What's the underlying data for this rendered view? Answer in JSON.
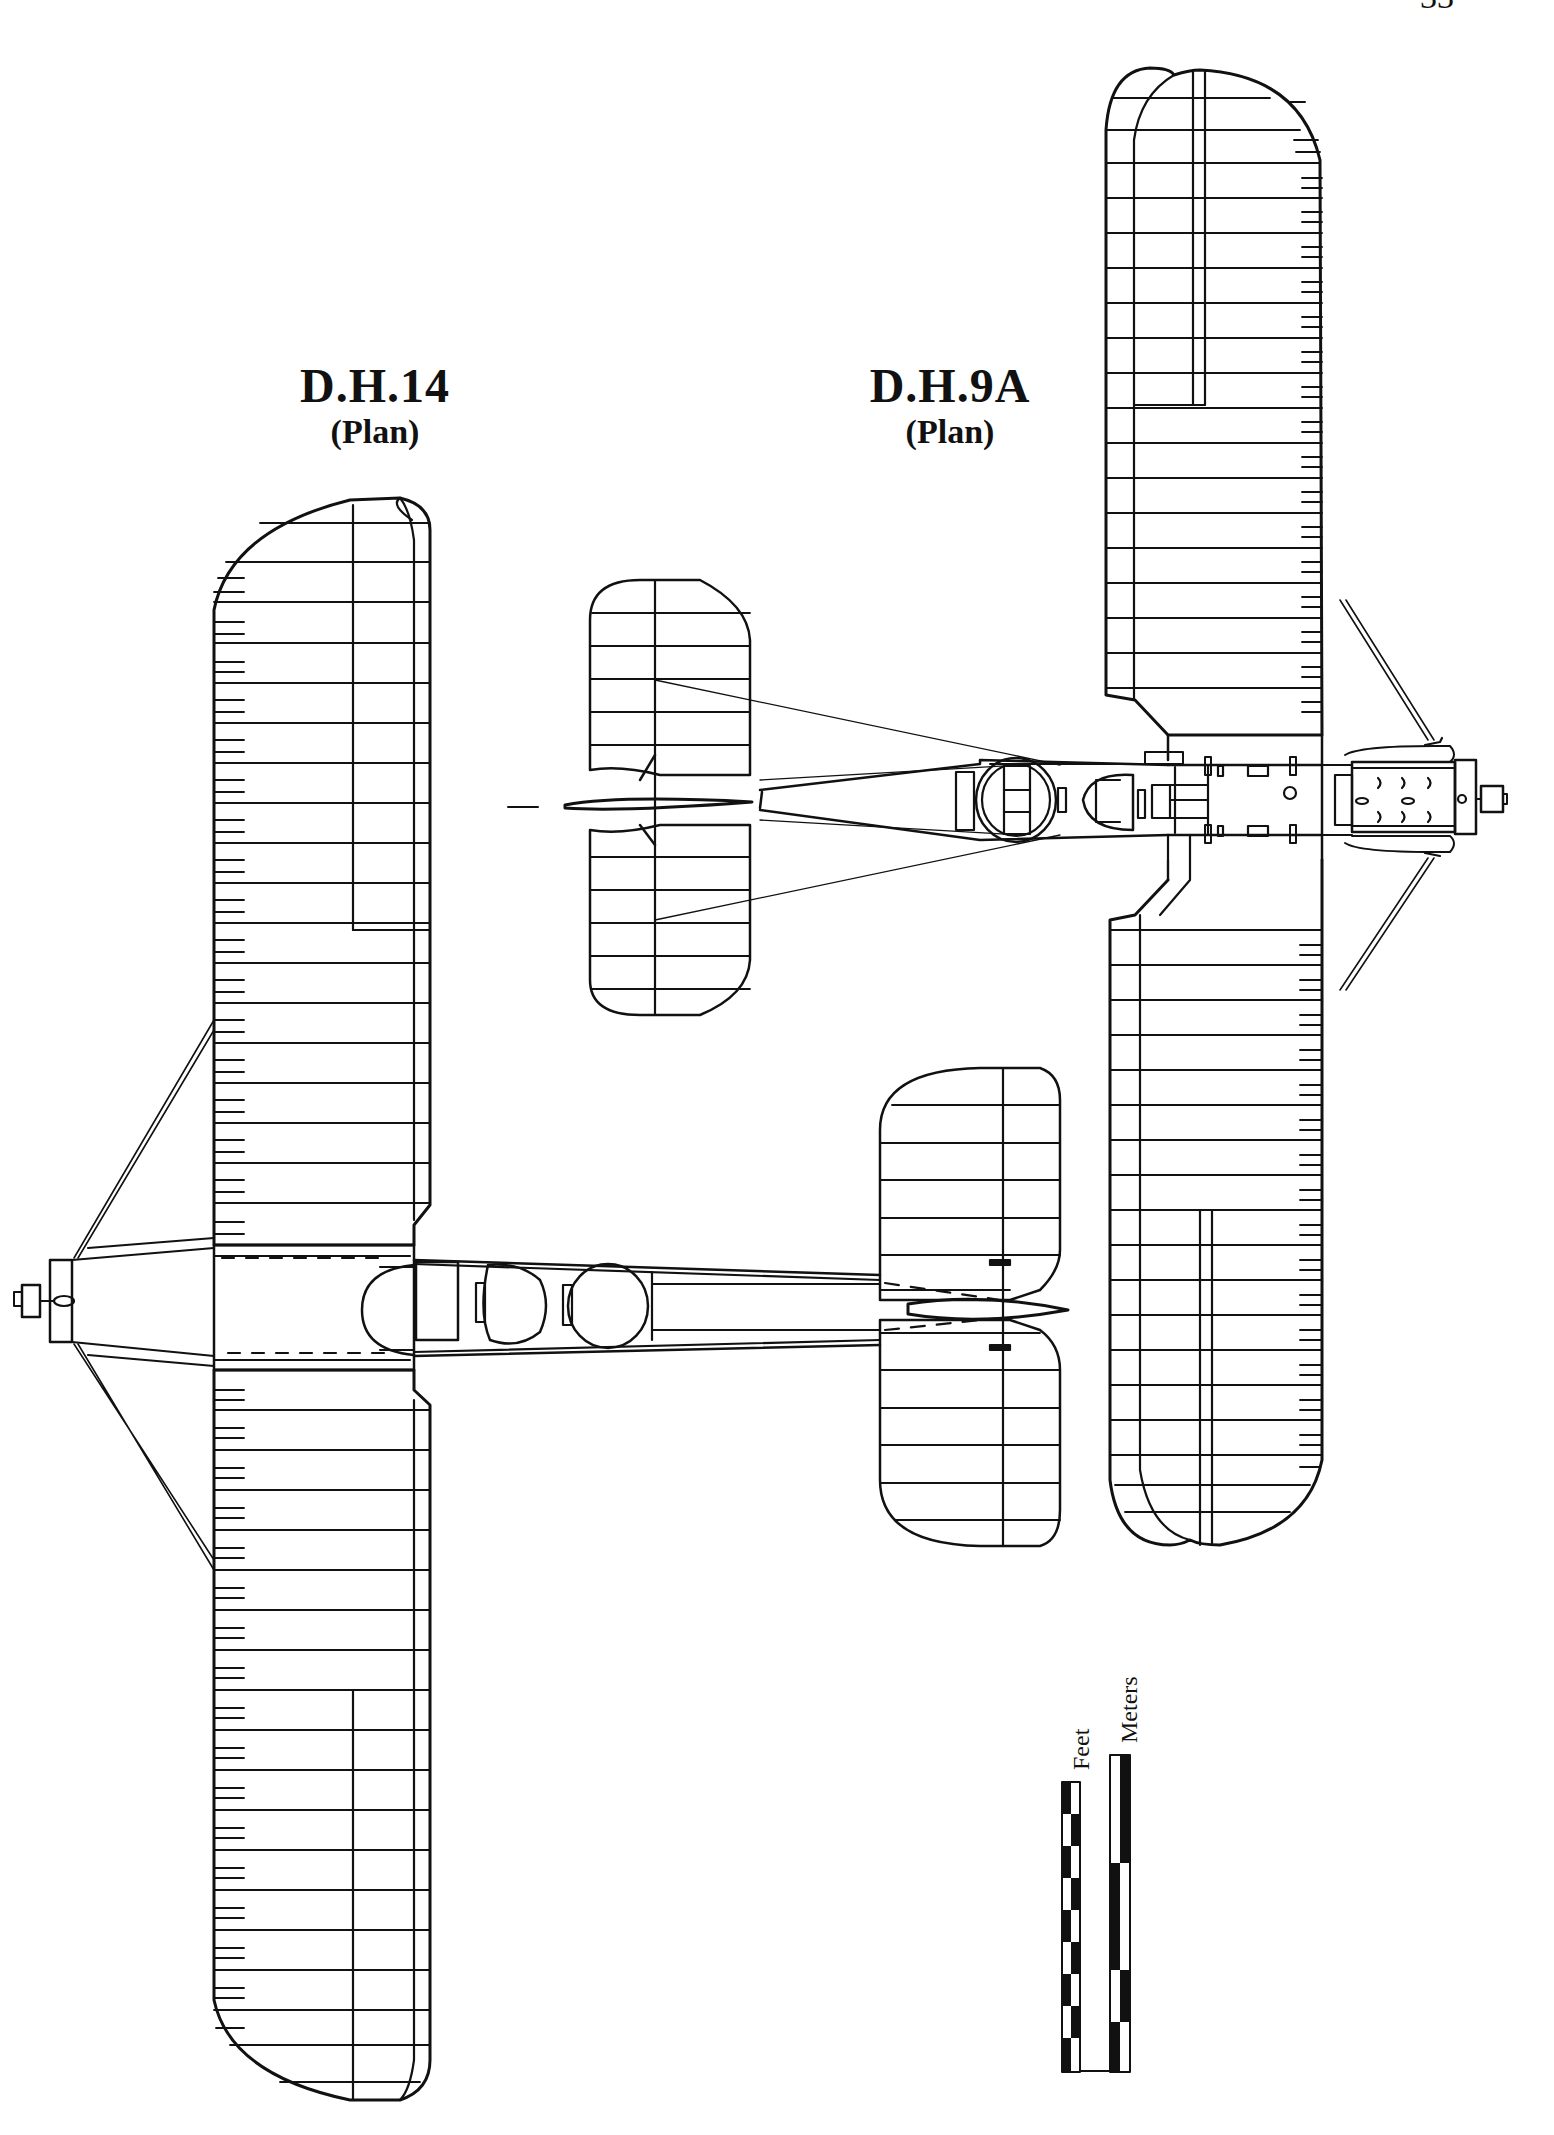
{
  "page": {
    "number": "33"
  },
  "drawings": [
    {
      "id": "dh14",
      "title": "D.H.14",
      "subtitle": "(Plan)"
    },
    {
      "id": "dh9a",
      "title": "D.H.9A",
      "subtitle": "(Plan)"
    }
  ],
  "scale_bar": {
    "feet_label": "Feet",
    "meters_label": "Meters",
    "feet_segments": 9,
    "meters_segments": 4
  },
  "colors": {
    "ink": "#111111",
    "paper": "#ffffff"
  }
}
